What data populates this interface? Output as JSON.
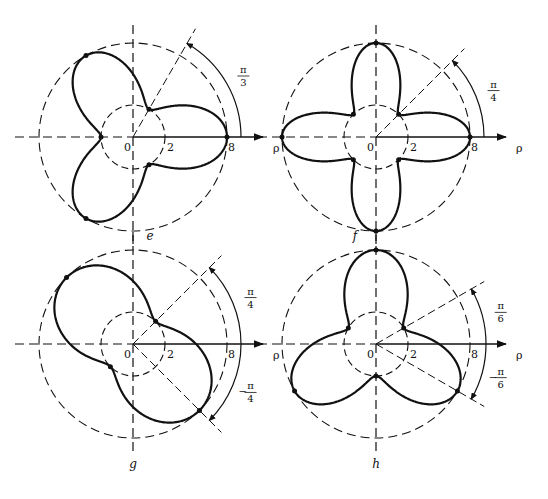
{
  "figure": {
    "axis_label": "ρ",
    "origin_label": "0",
    "inner_radius_label": "2",
    "outer_radius_label": "8",
    "panels": [
      {
        "id": "e",
        "caption": "e",
        "curve": "rose",
        "petals": 3,
        "petal_axes_deg": [
          0,
          120,
          240
        ],
        "r_min": 2,
        "r_max": 8,
        "angle_annotations": [
          {
            "label_num": "π",
            "label_den": "3",
            "sign": "",
            "angle_deg": 60
          }
        ]
      },
      {
        "id": "f",
        "caption": "f",
        "curve": "rose",
        "petals": 4,
        "petal_axes_deg": [
          0,
          90,
          180,
          270
        ],
        "r_min": 2,
        "r_max": 8,
        "angle_annotations": [
          {
            "label_num": "π",
            "label_den": "4",
            "sign": "",
            "angle_deg": 45
          }
        ]
      },
      {
        "id": "g",
        "caption": "g",
        "curve": "rose",
        "petals": 2,
        "petal_axes_deg": [
          -45,
          135
        ],
        "r_min": 2,
        "r_max": 8,
        "angle_annotations": [
          {
            "label_num": "π",
            "label_den": "4",
            "sign": "",
            "angle_deg": 45
          },
          {
            "label_num": "π",
            "label_den": "4",
            "sign": "−",
            "angle_deg": -45
          }
        ]
      },
      {
        "id": "h",
        "caption": "h",
        "curve": "rose",
        "petals": 3,
        "petal_axes_deg": [
          90,
          210,
          330
        ],
        "r_min": 2,
        "r_max": 8,
        "angle_annotations": [
          {
            "label_num": "π",
            "label_den": "6",
            "sign": "",
            "angle_deg": 30
          },
          {
            "label_num": "π",
            "label_den": "6",
            "sign": "−",
            "angle_deg": -30
          }
        ]
      }
    ]
  }
}
